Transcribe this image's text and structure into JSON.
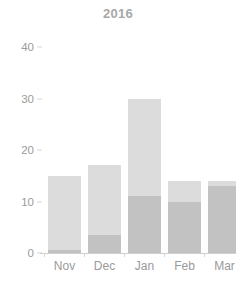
{
  "chart_data": {
    "type": "bar",
    "title": "2016",
    "subtitle": "",
    "xlabel": "",
    "ylabel": "",
    "categories": [
      "Nov",
      "Dec",
      "Jan",
      "Feb",
      "Mar"
    ],
    "series": [
      {
        "name": "lower-segment",
        "color": "#c2c2c2",
        "values": [
          0.5,
          3.5,
          11,
          10,
          13
        ]
      },
      {
        "name": "upper-segment",
        "color": "#dcdcdc",
        "values": [
          14.5,
          13.5,
          19,
          4,
          1
        ]
      }
    ],
    "totals": [
      15,
      17,
      30,
      14,
      14
    ],
    "stacked": true,
    "ylim": [
      0,
      40
    ],
    "yticks": [
      0,
      10,
      20,
      30,
      40
    ],
    "ytick_labels": [
      "0",
      "10",
      "20",
      "30",
      "40"
    ],
    "grid": false,
    "legend": "none",
    "bar_color_upper": "#dcdcdc",
    "bar_color_lower": "#c2c2c2",
    "axis_color": "#cfcfcf",
    "text_color": "#9a9a9a",
    "title_color": "#a8a8a8",
    "background": "#ffffff"
  }
}
